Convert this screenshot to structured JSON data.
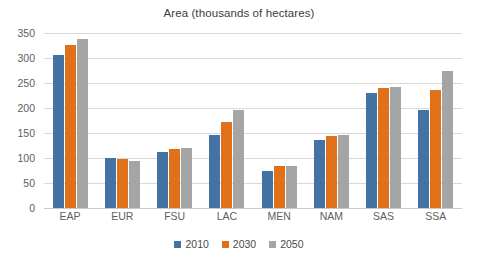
{
  "chart_data": {
    "type": "bar",
    "title": "Area (thousands of hectares)",
    "xlabel": "",
    "ylabel": "",
    "ylim": [
      0,
      350
    ],
    "ytick_step": 50,
    "yticks": [
      350,
      300,
      250,
      200,
      150,
      100,
      50,
      0
    ],
    "grid": true,
    "legend_position": "bottom",
    "categories": [
      "EAP",
      "EUR",
      "FSU",
      "LAC",
      "MEN",
      "NAM",
      "SAS",
      "SSA"
    ],
    "series": [
      {
        "name": "2010",
        "color": "#4472A4",
        "values": [
          306,
          100,
          113,
          147,
          75,
          137,
          231,
          196
        ]
      },
      {
        "name": "2030",
        "color": "#E0701A",
        "values": [
          326,
          98,
          119,
          172,
          84,
          145,
          240,
          237
        ]
      },
      {
        "name": "2050",
        "color": "#A5A5A5",
        "values": [
          338,
          95,
          120,
          196,
          85,
          147,
          243,
          274
        ]
      }
    ]
  }
}
